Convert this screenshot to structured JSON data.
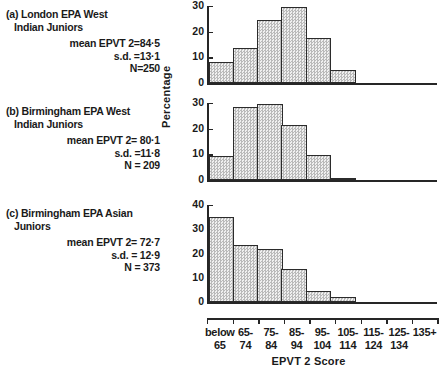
{
  "figure": {
    "y_axis_title": "Percentage",
    "x_axis_title": "EPVT 2 Score"
  },
  "panels": [
    {
      "key": "a",
      "title": "(a) London EPA West\nIndian Juniors",
      "mean_line": "mean EPVT 2=84·5",
      "sd_line": "s.d. =13·1",
      "n_line": "N=250"
    },
    {
      "key": "b",
      "title": "(b) Birmingham EPA West\nIndian Juniors",
      "mean_line": "mean EPVT 2= 80·1",
      "sd_line": "s.d. =11·8",
      "n_line": "N = 209"
    },
    {
      "key": "c",
      "title": "(c) Birmingham EPA Asian\nJuniors",
      "mean_line": "mean EPVT 2= 72·7",
      "sd_line": "s.d. = 12·9",
      "n_line": "N = 373"
    }
  ],
  "categories": [
    {
      "l1": "below",
      "l2": "65"
    },
    {
      "l1": "65-",
      "l2": "74"
    },
    {
      "l1": "75-",
      "l2": "84"
    },
    {
      "l1": "85-",
      "l2": "94"
    },
    {
      "l1": "95-",
      "l2": "104"
    },
    {
      "l1": "105-",
      "l2": "114"
    },
    {
      "l1": "115-",
      "l2": "124"
    },
    {
      "l1": "125-",
      "l2": "134"
    },
    {
      "l1": "135+",
      "l2": ""
    }
  ],
  "yticks": {
    "a": [
      "0",
      "10",
      "20",
      "30"
    ],
    "b": [
      "0",
      "10",
      "20",
      "30"
    ],
    "c": [
      "0",
      "10",
      "20",
      "30",
      "40"
    ]
  },
  "chart_data": {
    "type": "bar",
    "xlabel": "EPVT 2 Score",
    "ylabel": "Percentage",
    "grid": false,
    "legend": "none",
    "categories": [
      "below 65",
      "65-74",
      "75-84",
      "85-94",
      "95-104",
      "105-114",
      "115-124",
      "125-134",
      "135+"
    ],
    "panels": [
      {
        "label": "(a) London EPA West Indian Juniors",
        "mean_epvt2": 84.5,
        "sd": 13.1,
        "n": 250,
        "ylim": [
          0,
          30
        ],
        "yticks": [
          0,
          10,
          20,
          30
        ],
        "values": [
          8,
          13.5,
          24.5,
          29.5,
          17.5,
          5,
          0,
          0,
          0
        ]
      },
      {
        "label": "(b) Birmingham EPA West Indian Juniors",
        "mean_epvt2": 80.1,
        "sd": 11.8,
        "n": 209,
        "ylim": [
          0,
          30
        ],
        "yticks": [
          0,
          10,
          20,
          30
        ],
        "values": [
          9.5,
          28.5,
          29.5,
          21.5,
          9.8,
          0.5,
          0,
          0,
          0
        ]
      },
      {
        "label": "(c) Birmingham EPA Asian Juniors",
        "mean_epvt2": 72.7,
        "sd": 12.9,
        "n": 373,
        "ylim": [
          0,
          40
        ],
        "yticks": [
          0,
          10,
          20,
          30,
          40
        ],
        "values": [
          35,
          23.5,
          22,
          13.5,
          4.5,
          2,
          0,
          0,
          0
        ]
      }
    ]
  }
}
